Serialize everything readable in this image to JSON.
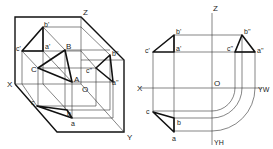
{
  "left_diagram": {
    "title": "oblique-view",
    "axis_labels": {
      "z": "Z",
      "x": "X",
      "y": "Y",
      "origin": "O"
    },
    "space_points": {
      "A": "A",
      "B": "B",
      "C": "C"
    },
    "v_projection": {
      "a": "a'",
      "b": "b'",
      "c": "c'"
    },
    "w_projection": {
      "a": "a''",
      "b": "b''",
      "c": "c''"
    },
    "h_projection": {
      "a": "a",
      "b": "b",
      "c": "c"
    }
  },
  "right_diagram": {
    "title": "three-view-projection",
    "axis_labels": {
      "z": "Z",
      "x": "X",
      "yw": "YW",
      "yh": "YH",
      "origin": "O"
    },
    "v_projection": {
      "a": "a'",
      "b": "b'",
      "c": "c'"
    },
    "w_projection": {
      "a": "a''",
      "b": "b''",
      "c": "c''"
    },
    "h_projection": {
      "a": "a",
      "b": "b",
      "c": "c"
    }
  }
}
